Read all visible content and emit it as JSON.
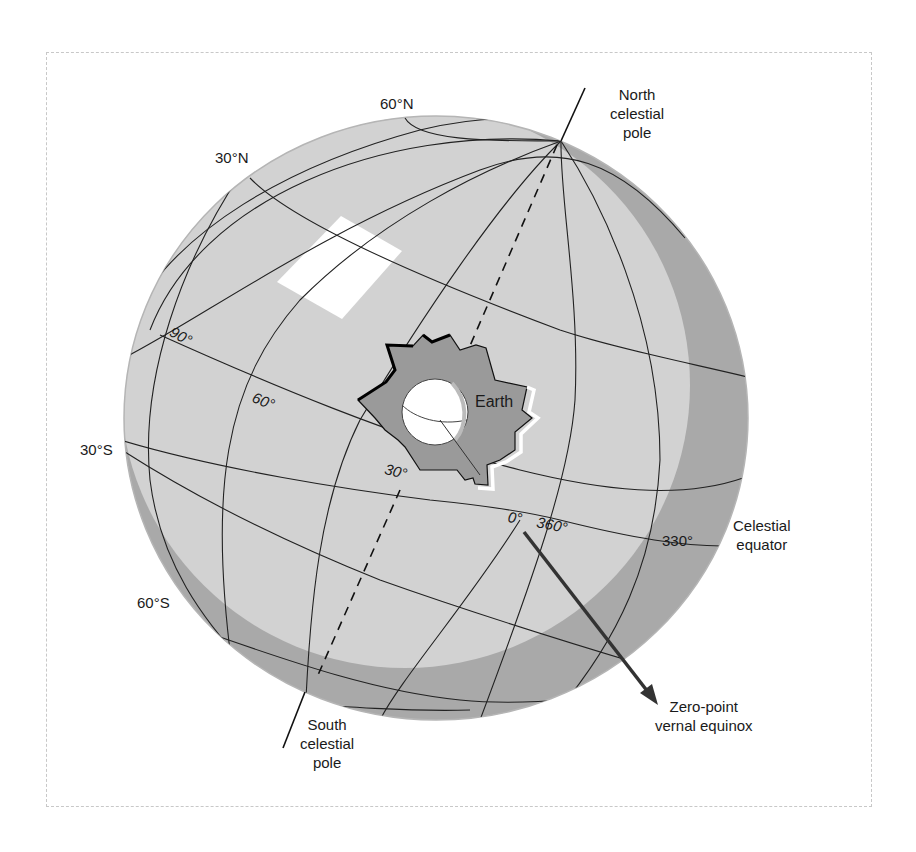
{
  "figure": {
    "type": "celestial-sphere-diagram",
    "colors": {
      "sphere_light": "#d2d2d2",
      "sphere_shadow": "#a9a9a9",
      "grid_line": "#222222",
      "earth_cutout": "#9a9a9a",
      "highlight": "#ffffff",
      "arrow": "#333333"
    }
  },
  "labels": {
    "north_pole": [
      "North",
      "celestial",
      "pole"
    ],
    "south_pole": [
      "South",
      "celestial",
      "pole"
    ],
    "celestial_equator": [
      "Celestial",
      "equator"
    ],
    "vernal_equinox": [
      "Zero-point",
      "vernal equinox"
    ],
    "earth": "Earth"
  },
  "declination_labels": {
    "n60": "60°N",
    "n30": "30°N",
    "s30": "30°S",
    "s60": "60°S"
  },
  "right_ascension_labels": {
    "ra90": "90°",
    "ra60": "60°",
    "ra30": "30°",
    "ra0": "0°",
    "ra360": "360°",
    "ra330": "330°"
  }
}
